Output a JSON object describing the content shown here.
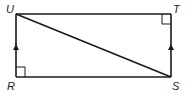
{
  "diagram": {
    "type": "quadrilateral",
    "shape": "rectangle RSTU with diagonal US",
    "vertices": [
      {
        "name": "U",
        "label": "U",
        "x": 16,
        "y": 14
      },
      {
        "name": "T",
        "label": "T",
        "x": 171,
        "y": 14
      },
      {
        "name": "S",
        "label": "S",
        "x": 171,
        "y": 77
      },
      {
        "name": "R",
        "label": "R",
        "x": 16,
        "y": 77
      }
    ],
    "segments": [
      "UT",
      "TS",
      "SR",
      "RU",
      "US"
    ],
    "right_angle_marks": [
      "T",
      "R"
    ],
    "parallel_marks": [
      "RU",
      "ST"
    ],
    "stroke_color": "#1a1a1a"
  }
}
